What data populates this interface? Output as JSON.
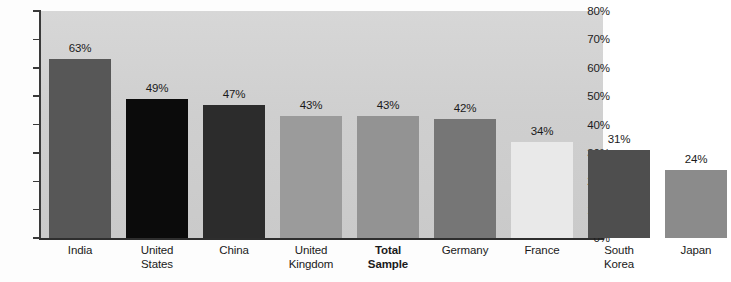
{
  "chart_data": {
    "type": "bar",
    "title": "",
    "subtitle": "",
    "xlabel": "",
    "ylabel": "",
    "ylim": [
      0,
      80
    ],
    "ytick_labels": [
      "0%",
      "10%",
      "20%",
      "30%",
      "40%",
      "50%",
      "60%",
      "70%",
      "80%"
    ],
    "ytick_values": [
      0,
      10,
      20,
      30,
      40,
      50,
      60,
      70,
      80
    ],
    "grid": false,
    "legend": "none",
    "categories": [
      "India",
      "United States",
      "China",
      "United Kingdom",
      "Total Sample",
      "Germany",
      "France",
      "South Korea",
      "Japan"
    ],
    "values": [
      63,
      49,
      47,
      43,
      43,
      42,
      34,
      31,
      24
    ],
    "value_labels": [
      "63%",
      "49%",
      "47%",
      "43%",
      "43%",
      "42%",
      "34%",
      "31%",
      "24%"
    ],
    "bars": [
      {
        "label_lines": [
          "India"
        ],
        "value": 63,
        "value_label": "63%",
        "color": "#575757",
        "bold": false
      },
      {
        "label_lines": [
          "United",
          "States"
        ],
        "value": 49,
        "value_label": "49%",
        "color": "#0b0b0b",
        "bold": false
      },
      {
        "label_lines": [
          "China"
        ],
        "value": 47,
        "value_label": "47%",
        "color": "#2c2c2c",
        "bold": false
      },
      {
        "label_lines": [
          "United",
          "Kingdom"
        ],
        "value": 43,
        "value_label": "43%",
        "color": "#9b9b9b",
        "bold": false
      },
      {
        "label_lines": [
          "Total",
          "Sample"
        ],
        "value": 43,
        "value_label": "43%",
        "color": "#939393",
        "bold": true
      },
      {
        "label_lines": [
          "Germany"
        ],
        "value": 42,
        "value_label": "42%",
        "color": "#767676",
        "bold": false
      },
      {
        "label_lines": [
          "France"
        ],
        "value": 34,
        "value_label": "34%",
        "color": "#e9e9e9",
        "bold": false
      },
      {
        "label_lines": [
          "South",
          "Korea"
        ],
        "value": 31,
        "value_label": "31%",
        "color": "#4e4e4e",
        "bold": false
      },
      {
        "label_lines": [
          "Japan"
        ],
        "value": 24,
        "value_label": "24%",
        "color": "#8b8b8b",
        "bold": false
      }
    ],
    "colors": {
      "plot_background": "#d2d2d2",
      "page_background": "#fdfdfd",
      "axis": "#2e2e2e",
      "text": "#1a1a1a"
    }
  }
}
